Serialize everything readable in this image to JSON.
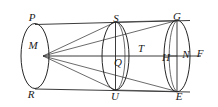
{
  "figure": {
    "background_color": "#ffffff",
    "line_color": "#262626",
    "label_color": "#1a1a1a",
    "width": 218,
    "height": 107
  },
  "labels": [
    {
      "text": "P",
      "x": 32,
      "y": 17,
      "name": "point-label-p"
    },
    {
      "text": "M",
      "x": 33,
      "y": 45,
      "name": "point-label-m"
    },
    {
      "text": "R",
      "x": 31,
      "y": 94,
      "name": "point-label-r"
    },
    {
      "text": "S",
      "x": 116,
      "y": 18,
      "name": "point-label-s"
    },
    {
      "text": "T",
      "x": 141,
      "y": 48,
      "name": "point-label-t"
    },
    {
      "text": "Q",
      "x": 118,
      "y": 62,
      "name": "point-label-q"
    },
    {
      "text": "U",
      "x": 115,
      "y": 96,
      "name": "point-label-u"
    },
    {
      "text": "G",
      "x": 177,
      "y": 16,
      "name": "point-label-g"
    },
    {
      "text": "H",
      "x": 166,
      "y": 57,
      "name": "point-label-h"
    },
    {
      "text": "N",
      "x": 186,
      "y": 54,
      "name": "point-label-n"
    },
    {
      "text": "F",
      "x": 200,
      "y": 53,
      "name": "point-label-f"
    },
    {
      "text": "E",
      "x": 179,
      "y": 96,
      "name": "point-label-e"
    }
  ],
  "geometry": {
    "apex": {
      "x": 43,
      "y": 56,
      "name": "apex-m"
    },
    "ellipses": [
      {
        "name": "ellipse-left",
        "cx": 35,
        "cy": 56,
        "rx": 14,
        "ry": 32
      },
      {
        "name": "ellipse-middle",
        "cx": 115,
        "cy": 56,
        "rx": 13,
        "ry": 34
      },
      {
        "name": "ellipse-right",
        "cx": 177,
        "cy": 56,
        "rx": 13,
        "ry": 36
      },
      {
        "name": "ellipse-inner-middle",
        "cx": 120,
        "cy": 56,
        "rx": 9,
        "ry": 34
      },
      {
        "name": "ellipse-inner-right",
        "cx": 172,
        "cy": 56,
        "rx": 9,
        "ry": 36
      }
    ],
    "lines": [
      {
        "name": "top-generatrix",
        "x1": 35,
        "y1": 24,
        "x2": 190,
        "y2": 20
      },
      {
        "name": "bottom-generatrix",
        "x1": 35,
        "y1": 89,
        "x2": 190,
        "y2": 92
      },
      {
        "name": "axis-line",
        "x1": 43,
        "y1": 56,
        "x2": 200,
        "y2": 56
      },
      {
        "name": "ray-m-to-s",
        "x1": 43,
        "y1": 56,
        "x2": 115,
        "y2": 22
      },
      {
        "name": "ray-m-to-g",
        "x1": 43,
        "y1": 56,
        "x2": 177,
        "y2": 20
      },
      {
        "name": "ray-m-to-u",
        "x1": 43,
        "y1": 56,
        "x2": 115,
        "y2": 90
      },
      {
        "name": "ray-m-to-e",
        "x1": 43,
        "y1": 56,
        "x2": 177,
        "y2": 92
      },
      {
        "name": "chord-s-to-g",
        "x1": 115,
        "y1": 22,
        "x2": 177,
        "y2": 20
      },
      {
        "name": "chord-u-to-e",
        "x1": 115,
        "y1": 90,
        "x2": 177,
        "y2": 92
      },
      {
        "name": "vertical-s-u",
        "x1": 115,
        "y1": 22,
        "x2": 115,
        "y2": 90
      },
      {
        "name": "vertical-g-e",
        "x1": 177,
        "y1": 20,
        "x2": 177,
        "y2": 92
      }
    ]
  }
}
